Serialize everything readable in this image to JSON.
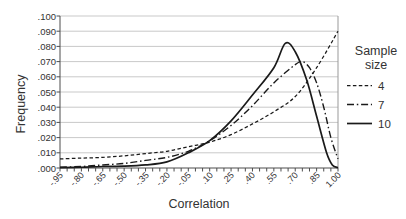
{
  "chart": {
    "background": "#ffffff",
    "axis_color": "#4d4d4d",
    "gridline_color": "#c9c9c9",
    "border_color": "#999999",
    "line_color": "#1a1a1a",
    "text_color": "#333333"
  },
  "chart_data": {
    "type": "line",
    "title": "",
    "xlabel": "Correlation",
    "ylabel": "Frequency",
    "xlim": [
      -0.95,
      1.0
    ],
    "ylim": [
      0,
      0.1
    ],
    "grid": "horizontal",
    "legend_position": "right",
    "x_tick_labels": [
      "-.95",
      "-.80",
      "-.65",
      "-.50",
      "-.35",
      "-.20",
      "-.05",
      ".10",
      ".25",
      ".40",
      ".55",
      ".70",
      ".85",
      "1.00"
    ],
    "x_tick_values": [
      -0.95,
      -0.8,
      -0.65,
      -0.5,
      -0.35,
      -0.2,
      -0.05,
      0.1,
      0.25,
      0.4,
      0.55,
      0.7,
      0.85,
      1.0
    ],
    "x_minor_tick_step": 0.05,
    "y_tick_labels": [
      ".100",
      ".090",
      ".080",
      ".070",
      ".060",
      ".050",
      ".040",
      ".030",
      ".020",
      ".010",
      ".000"
    ],
    "y_tick_values": [
      0.1,
      0.09,
      0.08,
      0.07,
      0.06,
      0.05,
      0.04,
      0.03,
      0.02,
      0.01,
      0
    ],
    "legend": {
      "title_lines": [
        "Sample",
        "size"
      ],
      "items": [
        {
          "label": "4",
          "style": "dashed"
        },
        {
          "label": "7",
          "style": "dash-dot"
        },
        {
          "label": "10",
          "style": "solid"
        }
      ]
    },
    "series": [
      {
        "name": "4",
        "line_style": "dashed",
        "points": [
          [
            -0.95,
            0.006
          ],
          [
            -0.8,
            0.0065
          ],
          [
            -0.65,
            0.007
          ],
          [
            -0.5,
            0.008
          ],
          [
            -0.35,
            0.0095
          ],
          [
            -0.2,
            0.011
          ],
          [
            -0.05,
            0.014
          ],
          [
            0.1,
            0.017
          ],
          [
            0.25,
            0.022
          ],
          [
            0.4,
            0.029
          ],
          [
            0.55,
            0.037
          ],
          [
            0.7,
            0.047
          ],
          [
            0.85,
            0.066
          ],
          [
            1.0,
            0.09
          ]
        ]
      },
      {
        "name": "7",
        "line_style": "dash-dot",
        "points": [
          [
            -0.95,
            0.0005
          ],
          [
            -0.8,
            0.001
          ],
          [
            -0.65,
            0.002
          ],
          [
            -0.5,
            0.003
          ],
          [
            -0.35,
            0.005
          ],
          [
            -0.2,
            0.007
          ],
          [
            -0.05,
            0.011
          ],
          [
            0.1,
            0.018
          ],
          [
            0.25,
            0.028
          ],
          [
            0.4,
            0.041
          ],
          [
            0.55,
            0.056
          ],
          [
            0.7,
            0.068
          ],
          [
            0.75,
            0.07
          ],
          [
            0.8,
            0.066
          ],
          [
            0.85,
            0.056
          ],
          [
            0.9,
            0.04
          ],
          [
            0.95,
            0.02
          ],
          [
            1.0,
            0.006
          ]
        ]
      },
      {
        "name": "10",
        "line_style": "solid",
        "points": [
          [
            -0.95,
            0.0002
          ],
          [
            -0.8,
            0.0005
          ],
          [
            -0.65,
            0.001
          ],
          [
            -0.5,
            0.0012
          ],
          [
            -0.35,
            0.002
          ],
          [
            -0.2,
            0.004
          ],
          [
            -0.05,
            0.01
          ],
          [
            0.1,
            0.018
          ],
          [
            0.25,
            0.031
          ],
          [
            0.4,
            0.048
          ],
          [
            0.55,
            0.066
          ],
          [
            0.63,
            0.082
          ],
          [
            0.7,
            0.0765
          ],
          [
            0.78,
            0.058
          ],
          [
            0.85,
            0.034
          ],
          [
            0.92,
            0.01
          ],
          [
            0.96,
            0.002
          ],
          [
            1.0,
            0.0002
          ]
        ]
      }
    ]
  }
}
